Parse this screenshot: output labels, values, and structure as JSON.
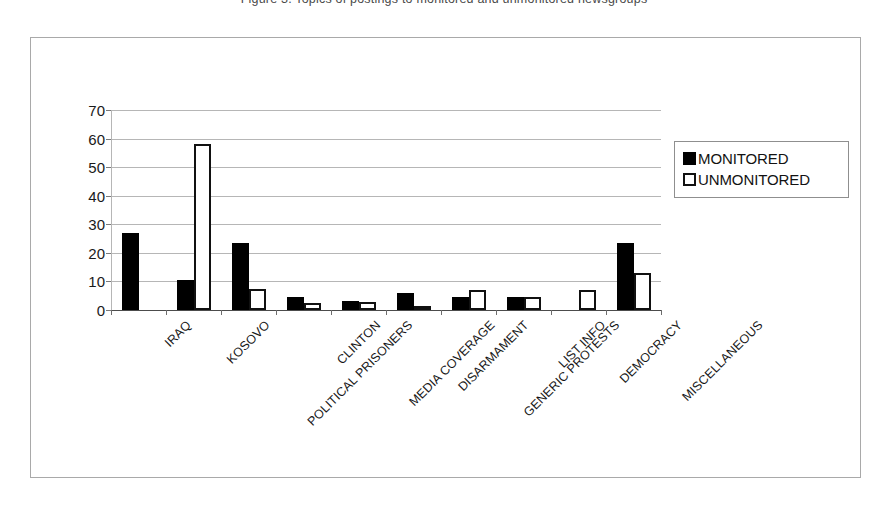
{
  "caption_sliver": "Figure 3. Topics of postings to monitored and unmonitored newsgroups",
  "figure": {
    "frame_label": "chart-figure-frame"
  },
  "chart_data": {
    "type": "bar",
    "title": "",
    "xlabel": "",
    "ylabel": "",
    "ylim": [
      0,
      70
    ],
    "yticks": [
      0,
      10,
      20,
      30,
      40,
      50,
      60,
      70
    ],
    "grid": true,
    "legend_position": "right",
    "categories": [
      "IRAQ",
      "KOSOVO",
      "POLITICAL PRISONERS",
      "CLINTON",
      "MEDIA COVERAGE",
      "DISARMAMENT",
      "GENERIC PROTESTS",
      "LIST INFO",
      "DEMOCRACY",
      "MISCELLANEOUS"
    ],
    "series": [
      {
        "name": "MONITORED",
        "color": "#000000",
        "style": "filled",
        "values": [
          27,
          10.5,
          23.5,
          4.5,
          3,
          6,
          4.5,
          4.5,
          0,
          23.5
        ]
      },
      {
        "name": "UNMONITORED",
        "color": "#ffffff",
        "style": "hollow",
        "values": [
          0,
          58,
          7.5,
          2.5,
          2.8,
          1.5,
          7,
          4.5,
          7,
          13
        ]
      }
    ]
  },
  "legend": {
    "items": [
      {
        "label": "MONITORED",
        "swatch": "filled-square-icon"
      },
      {
        "label": "UNMONITORED",
        "swatch": "hollow-square-icon"
      }
    ]
  }
}
